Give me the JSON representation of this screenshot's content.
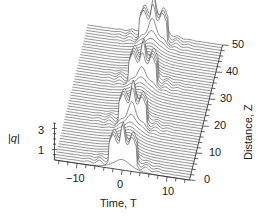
{
  "chart_data": {
    "type": "waterfall-3d",
    "title": "",
    "xlabel": "Time, T",
    "ylabel": "Distance, Z",
    "zlabel": "|q|",
    "x_ticks": [
      -10,
      0,
      10
    ],
    "y_ticks": [
      0,
      10,
      20,
      30,
      40,
      50
    ],
    "z_ticks": [
      1,
      3
    ],
    "xlim": [
      -15,
      15
    ],
    "ylim": [
      0,
      50
    ],
    "zlim": [
      0,
      3.5
    ],
    "n_traces": 50,
    "peak_events": [
      {
        "z": 17,
        "peak_height": 3.2,
        "width_T": 6
      },
      {
        "z": 33,
        "peak_height": 3.2,
        "width_T": 6
      },
      {
        "z": 48,
        "peak_height": 3.2,
        "width_T": 6
      }
    ],
    "initial_pulse": {
      "center_T": 0,
      "amplitude": 1,
      "shape": "sech"
    }
  },
  "labels": {
    "x_axis": "Time, T",
    "y_axis": "Distance, Z",
    "z_axis_prefix": "|",
    "z_axis_var": "q",
    "z_axis_suffix": "|",
    "x_tick_0": "−10",
    "x_tick_1": "0",
    "x_tick_2": "10",
    "y_tick_0": "0",
    "y_tick_1": "10",
    "y_tick_2": "20",
    "y_tick_3": "30",
    "y_tick_4": "40",
    "y_tick_5": "50",
    "z_tick_0": "1",
    "z_tick_1": "3"
  }
}
